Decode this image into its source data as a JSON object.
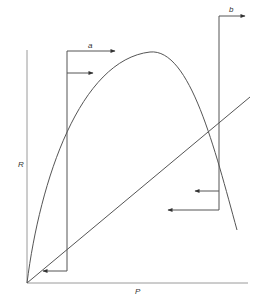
{
  "diagram": {
    "axes": {
      "x_label": "P",
      "y_label": "R"
    },
    "curves": [
      {
        "name": "R-curve",
        "description": "concave curve rising from origin to a maximum, then falling"
      },
      {
        "name": "replacement-line",
        "description": "straight diagonal line from origin"
      }
    ],
    "annotations": [
      {
        "label": "a",
        "description": "bracket at left with rightward arrows at top and leftward arrow at bottom"
      },
      {
        "label": "b",
        "description": "bracket at right with rightward arrow at top and two leftward arrows lower down"
      }
    ]
  }
}
